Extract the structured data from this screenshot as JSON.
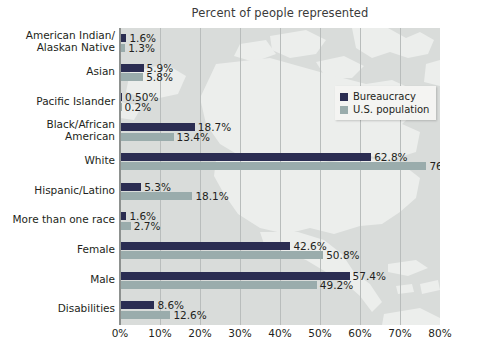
{
  "chart_data": {
    "type": "bar",
    "orientation": "horizontal",
    "title": "Percent of people represented",
    "xlabel": "",
    "ylabel": "",
    "xlim": [
      0,
      80
    ],
    "xticks": [
      "0%",
      "10%",
      "20%",
      "30%",
      "40%",
      "50%",
      "60%",
      "70%",
      "80%"
    ],
    "xtick_values": [
      0,
      10,
      20,
      30,
      40,
      50,
      60,
      70,
      80
    ],
    "grid": true,
    "legend_position": "upper-right-inside",
    "categories": [
      "American Indian/\nAlaskan Native",
      "Asian",
      "Pacific Islander",
      "Black/African\nAmerican",
      "White",
      "Hispanic/Latino",
      "More than one race",
      "Female",
      "Male",
      "Disabilities"
    ],
    "series": [
      {
        "name": "Bureaucracy",
        "color": "#2b2d52",
        "values": [
          1.6,
          5.9,
          0.5,
          18.7,
          62.8,
          5.3,
          1.6,
          42.6,
          57.4,
          8.6
        ],
        "labels": [
          "1.6%",
          "5.9%",
          "0.50%",
          "18.7%",
          "62.8%",
          "5.3%",
          "1.6%",
          "42.6%",
          "57.4%",
          "8.6%"
        ]
      },
      {
        "name": "U.S. population",
        "color": "#9aacac",
        "values": [
          1.3,
          5.8,
          0.2,
          13.4,
          76.6,
          18.1,
          2.7,
          50.8,
          49.2,
          12.6
        ],
        "labels": [
          "1.3%",
          "5.8%",
          "0.2%",
          "13.4%",
          "76.6%",
          "18.1%",
          "2.7%",
          "50.8%",
          "49.2%",
          "12.6%"
        ]
      }
    ],
    "background_image": "north-america-map-watermark",
    "colors": {
      "plot_background": "#d9dcda",
      "gridline": "#b9bdbc",
      "axis": "#8d918f",
      "text": "#231f20",
      "legend_background": "#f4f4f2"
    }
  }
}
